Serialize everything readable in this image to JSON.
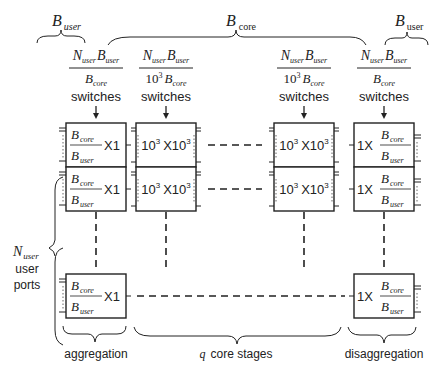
{
  "labels": {
    "b_user_left": {
      "main": "B",
      "sub": "user"
    },
    "b_core": {
      "main": "B",
      "sub": "core"
    },
    "b_user_right": {
      "main": "B",
      "sub": "user"
    },
    "n_user_ports": {
      "main": "N",
      "sub": "user",
      "line2": "user",
      "line3": "ports"
    },
    "aggregation": "aggregation",
    "core_stages_q": "q",
    "core_stages": "core stages",
    "disaggregation": "disaggregation"
  },
  "columns": [
    {
      "id": "aggregation",
      "count_numerator": {
        "a": "N",
        "a_sub": "user",
        "b": "B",
        "b_sub": "user"
      },
      "count_denominator": {
        "prefix": "",
        "prefix_sup": "",
        "b": "B",
        "b_sub": "core"
      },
      "caption": "switches",
      "box": {
        "kind": "ratio-left",
        "num": "B",
        "num_sub": "core",
        "den": "B",
        "den_sub": "user",
        "suffix": "X1"
      }
    },
    {
      "id": "core-first",
      "count_numerator": {
        "a": "N",
        "a_sub": "user",
        "b": "B",
        "b_sub": "user"
      },
      "count_denominator": {
        "prefix": "10",
        "prefix_sup": "3",
        "b": "B",
        "b_sub": "core"
      },
      "caption": "switches",
      "box": {
        "kind": "square",
        "text_a": "10",
        "sup_a": "3",
        "text_x": "X",
        "text_b": "10",
        "sup_b": "3"
      }
    },
    {
      "id": "core-last",
      "count_numerator": {
        "a": "N",
        "a_sub": "user",
        "b": "B",
        "b_sub": "user"
      },
      "count_denominator": {
        "prefix": "10",
        "prefix_sup": "3",
        "b": "B",
        "b_sub": "core"
      },
      "caption": "switches",
      "box": {
        "kind": "square",
        "text_a": "10",
        "sup_a": "3",
        "text_x": "X",
        "text_b": "10",
        "sup_b": "3"
      }
    },
    {
      "id": "disaggregation",
      "count_numerator": {
        "a": "N",
        "a_sub": "user",
        "b": "B",
        "b_sub": "user"
      },
      "count_denominator": {
        "prefix": "",
        "prefix_sup": "",
        "b": "B",
        "b_sub": "core"
      },
      "caption": "switches",
      "box": {
        "kind": "ratio-right",
        "prefix": "1X",
        "num": "B",
        "num_sub": "core",
        "den": "B",
        "den_sub": "user"
      }
    }
  ],
  "rows": [
    "row-1",
    "row-2",
    "row-last"
  ]
}
